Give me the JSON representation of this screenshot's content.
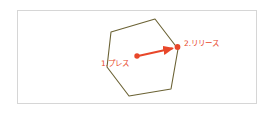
{
  "figure": {
    "panel": {
      "border_color": "#d6d6d6",
      "background": "#ffffff"
    },
    "shape": {
      "name": "hexagon",
      "stroke_color": "#6b6234",
      "fill": "none",
      "stroke_width": 1.1,
      "points": "155,19 111,32 107,67 129,96 171,89 178,49"
    },
    "gesture": {
      "accent_color": "#e8472a",
      "start_point": {
        "x": 137,
        "y": 56
      },
      "end_point": {
        "x": 177,
        "y": 47
      },
      "arrow_stroke_width": 2.1,
      "dot_radius": 2.6
    },
    "labels": {
      "step1": "1.プレス",
      "step2": "2.リリース"
    }
  }
}
